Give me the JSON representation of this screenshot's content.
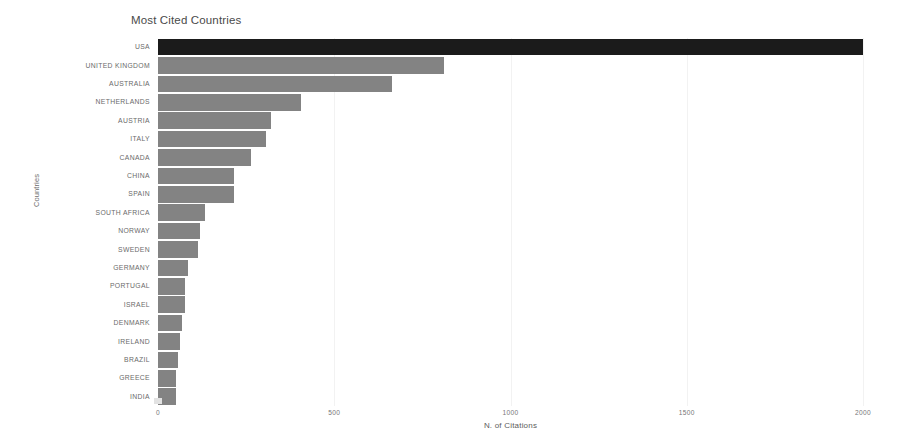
{
  "chart_data": {
    "type": "bar",
    "orientation": "horizontal",
    "title": "Most Cited Countries",
    "xlabel": "N. of Citations",
    "ylabel": "Countries",
    "xlim": [
      0,
      2000
    ],
    "ylim": null,
    "grid": true,
    "grid_axis": "x",
    "legend": null,
    "xticks": [
      0,
      500,
      1000,
      1500,
      2000
    ],
    "xtick_labels": [
      "0",
      "500",
      "1000",
      "1500",
      "2000"
    ],
    "categories": [
      "USA",
      "UNITED KINGDOM",
      "AUSTRALIA",
      "NETHERLANDS",
      "AUSTRIA",
      "ITALY",
      "CANADA",
      "CHINA",
      "SPAIN",
      "SOUTH AFRICA",
      "NORWAY",
      "SWEDEN",
      "GERMANY",
      "PORTUGAL",
      "ISRAEL",
      "DENMARK",
      "IRELAND",
      "BRAZIL",
      "GREECE",
      "INDIA"
    ],
    "values": [
      2000,
      812,
      665,
      406,
      321,
      307,
      264,
      216,
      216,
      134,
      119,
      114,
      85,
      77,
      77,
      68,
      63,
      57,
      51,
      51
    ],
    "bar_colors": [
      "#1b1b1b",
      "#838383",
      "#838383",
      "#838383",
      "#838383",
      "#838383",
      "#838383",
      "#838383",
      "#838383",
      "#838383",
      "#838383",
      "#838383",
      "#838383",
      "#838383",
      "#838383",
      "#838383",
      "#838383",
      "#838383",
      "#838383",
      "#838383"
    ],
    "highlight_color": "#1b1b1b",
    "default_color": "#838383",
    "background_color": "#ffffff",
    "grid_color": "#f2f2f2"
  }
}
